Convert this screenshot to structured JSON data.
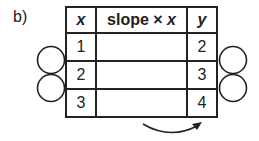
{
  "label": "b)",
  "table": {
    "headers": {
      "x": "x",
      "slope_prefix": "slope × ",
      "slope_var": "x",
      "y": "y"
    },
    "rows": [
      {
        "x": "1",
        "slope_x": "",
        "y": "2"
      },
      {
        "x": "2",
        "slope_x": "",
        "y": "3"
      },
      {
        "x": "3",
        "slope_x": "",
        "y": "4"
      }
    ]
  }
}
